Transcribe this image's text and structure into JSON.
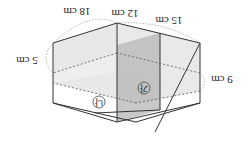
{
  "figure": {
    "orientation": "rotated-180",
    "labels": {
      "height_left": "5 cm",
      "height_right": "9 cm",
      "length": "18 cm",
      "partition_offset": "12 cm",
      "width": "15 cm"
    },
    "compartments": {
      "a": "가",
      "b": "나"
    },
    "colors": {
      "edge": "#333333",
      "water_light": "#e6e6e6",
      "water_dark": "#bdbdbd",
      "partition": "#a8a8a8",
      "dimension_arc": "#9a9a9a"
    }
  }
}
